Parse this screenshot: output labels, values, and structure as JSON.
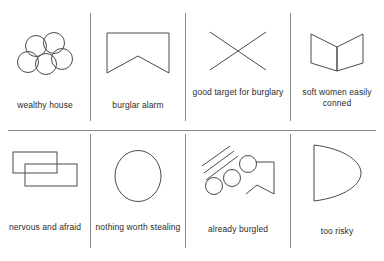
{
  "diagram": {
    "grid": {
      "columns": 4,
      "rows": 2
    },
    "colors": {
      "background": "#ffffff",
      "stroke": "#4a4a4a",
      "rule": "#8a8a8a",
      "text": "#2b2b2b"
    },
    "cells": [
      {
        "icon": "five-circles-cluster-icon",
        "label": "wealthy house"
      },
      {
        "icon": "notched-rectangle-alarm-icon",
        "label": "burglar alarm"
      },
      {
        "icon": "x-cross-icon",
        "label": "good target for burglary"
      },
      {
        "icon": "open-book-icon",
        "label": "soft women easily conned"
      },
      {
        "icon": "two-overlapping-rectangles-icon",
        "label": "nervous and afraid"
      },
      {
        "icon": "oval-icon",
        "label": "nothing worth stealing"
      },
      {
        "icon": "hatch-lines-circles-notched-shape-icon",
        "label": "already burgled"
      },
      {
        "icon": "d-shape-semicircle-icon",
        "label": "too risky"
      }
    ]
  }
}
